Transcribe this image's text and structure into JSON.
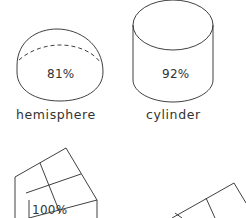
{
  "shapes": [
    {
      "name": "hemisphere",
      "percent": "81%"
    },
    {
      "name": "cylinder",
      "percent": "92%"
    },
    {
      "name": "cube",
      "percent": "100%"
    },
    {
      "name": "slab",
      "percent": "..."
    }
  ],
  "colors": {
    "stroke": "#2a2a2a",
    "background": "#ffffff"
  }
}
